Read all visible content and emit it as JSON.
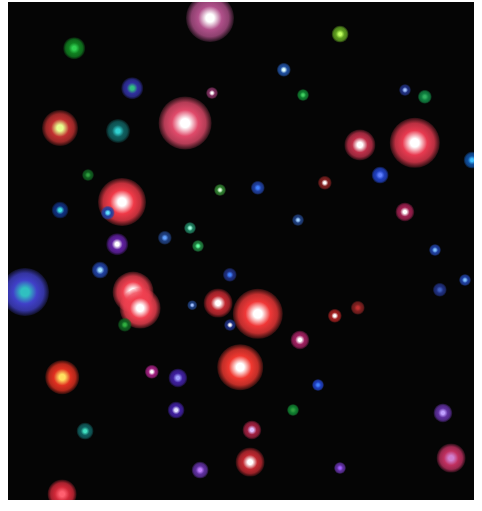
{
  "image": {
    "description": "Astronomical false-color star field",
    "background": "#050505",
    "frame": {
      "left": 8,
      "top": 2,
      "width": 466,
      "height": 498
    }
  },
  "stars": [
    {
      "x": 210,
      "y": 18,
      "r": 20,
      "halo": "#b0508a",
      "core": "#ffffff"
    },
    {
      "x": 185,
      "y": 123,
      "r": 22,
      "halo": "#e04a6a",
      "core": "#ffffff"
    },
    {
      "x": 415,
      "y": 143,
      "r": 21,
      "halo": "#e83a50",
      "core": "#ffffff"
    },
    {
      "x": 122,
      "y": 202,
      "r": 20,
      "halo": "#f03a48",
      "core": "#ffffff"
    },
    {
      "x": 60,
      "y": 128,
      "r": 15,
      "halo": "#c03030",
      "core": "#e8ff90"
    },
    {
      "x": 360,
      "y": 145,
      "r": 13,
      "halo": "#c0304a",
      "core": "#ffffff"
    },
    {
      "x": 133,
      "y": 292,
      "r": 17,
      "halo": "#f04050",
      "core": "#ffffff"
    },
    {
      "x": 140,
      "y": 308,
      "r": 17,
      "halo": "#f04050",
      "core": "#ffffff"
    },
    {
      "x": 258,
      "y": 314,
      "r": 21,
      "halo": "#f03838",
      "core": "#ffffff"
    },
    {
      "x": 240,
      "y": 367,
      "r": 19,
      "halo": "#f03830",
      "core": "#ffffff"
    },
    {
      "x": 218,
      "y": 303,
      "r": 12,
      "halo": "#c02830",
      "core": "#ffffff"
    },
    {
      "x": 62,
      "y": 377,
      "r": 14,
      "halo": "#e03020",
      "core": "#ffe060"
    },
    {
      "x": 25,
      "y": 292,
      "r": 20,
      "halo": "#4040c8",
      "core": "#30c0c0"
    },
    {
      "x": 451,
      "y": 458,
      "r": 12,
      "halo": "#c03060",
      "core": "#d080d0"
    },
    {
      "x": 250,
      "y": 462,
      "r": 12,
      "halo": "#c02830",
      "core": "#ffffff"
    },
    {
      "x": 62,
      "y": 494,
      "r": 12,
      "halo": "#d02838",
      "core": "#ff6070"
    },
    {
      "x": 74,
      "y": 48,
      "r": 9,
      "halo": "#108020",
      "core": "#30d050"
    },
    {
      "x": 340,
      "y": 34,
      "r": 7,
      "halo": "#60a020",
      "core": "#c0ff60"
    },
    {
      "x": 132,
      "y": 88,
      "r": 9,
      "halo": "#3030a0",
      "core": "#30c080"
    },
    {
      "x": 118,
      "y": 131,
      "r": 10,
      "halo": "#106060",
      "core": "#30d0d0"
    },
    {
      "x": 284,
      "y": 70,
      "r": 6,
      "halo": "#2050a0",
      "core": "#e0ffff"
    },
    {
      "x": 60,
      "y": 210,
      "r": 7,
      "halo": "#103080",
      "core": "#40e0e0"
    },
    {
      "x": 108,
      "y": 213,
      "r": 6,
      "halo": "#2040a0",
      "core": "#60e0ff"
    },
    {
      "x": 117,
      "y": 244,
      "r": 9,
      "halo": "#6020a0",
      "core": "#ffffff"
    },
    {
      "x": 100,
      "y": 270,
      "r": 7,
      "halo": "#2040a0",
      "core": "#a0e0ff"
    },
    {
      "x": 380,
      "y": 175,
      "r": 7,
      "halo": "#2040c0",
      "core": "#6080ff"
    },
    {
      "x": 472,
      "y": 160,
      "r": 7,
      "halo": "#1050a0",
      "core": "#40c0ff"
    },
    {
      "x": 405,
      "y": 212,
      "r": 8,
      "halo": "#a02050",
      "core": "#ffffff"
    },
    {
      "x": 325,
      "y": 183,
      "r": 6,
      "halo": "#802020",
      "core": "#ffffff"
    },
    {
      "x": 258,
      "y": 188,
      "r": 6,
      "halo": "#2040a0",
      "core": "#4080ff"
    },
    {
      "x": 220,
      "y": 190,
      "r": 5,
      "halo": "#308030",
      "core": "#e0ffe0"
    },
    {
      "x": 198,
      "y": 246,
      "r": 5,
      "halo": "#208040",
      "core": "#60ffa0"
    },
    {
      "x": 212,
      "y": 93,
      "r": 5,
      "halo": "#803060",
      "core": "#ffffff"
    },
    {
      "x": 303,
      "y": 95,
      "r": 5,
      "halo": "#108030",
      "core": "#40d060"
    },
    {
      "x": 425,
      "y": 97,
      "r": 6,
      "halo": "#108040",
      "core": "#30b060"
    },
    {
      "x": 405,
      "y": 90,
      "r": 5,
      "halo": "#203080",
      "core": "#a0c0ff"
    },
    {
      "x": 298,
      "y": 220,
      "r": 5,
      "halo": "#204080",
      "core": "#a0d0ff"
    },
    {
      "x": 300,
      "y": 340,
      "r": 8,
      "halo": "#a02060",
      "core": "#ffffff"
    },
    {
      "x": 230,
      "y": 325,
      "r": 5,
      "halo": "#203080",
      "core": "#ffffff"
    },
    {
      "x": 335,
      "y": 316,
      "r": 6,
      "halo": "#a02020",
      "core": "#ffffff"
    },
    {
      "x": 152,
      "y": 372,
      "r": 6,
      "halo": "#a02080",
      "core": "#ffffff"
    },
    {
      "x": 178,
      "y": 378,
      "r": 8,
      "halo": "#4020a0",
      "core": "#a0a0ff"
    },
    {
      "x": 176,
      "y": 410,
      "r": 7,
      "halo": "#4020a0",
      "core": "#e0e0ff"
    },
    {
      "x": 85,
      "y": 431,
      "r": 7,
      "halo": "#106060",
      "core": "#40e0c0"
    },
    {
      "x": 318,
      "y": 385,
      "r": 5,
      "halo": "#2040c0",
      "core": "#4080ff"
    },
    {
      "x": 293,
      "y": 410,
      "r": 5,
      "halo": "#108030",
      "core": "#30a040"
    },
    {
      "x": 443,
      "y": 413,
      "r": 8,
      "halo": "#6030a0",
      "core": "#c0a0ff"
    },
    {
      "x": 200,
      "y": 470,
      "r": 7,
      "halo": "#6030a0",
      "core": "#c080ff"
    },
    {
      "x": 340,
      "y": 468,
      "r": 5,
      "halo": "#6030a0",
      "core": "#a060ff"
    },
    {
      "x": 252,
      "y": 430,
      "r": 8,
      "halo": "#a02040",
      "core": "#e0c0ff"
    },
    {
      "x": 435,
      "y": 250,
      "r": 5,
      "halo": "#2040a0",
      "core": "#80c0ff"
    },
    {
      "x": 465,
      "y": 280,
      "r": 5,
      "halo": "#2040a0",
      "core": "#80c0ff"
    },
    {
      "x": 440,
      "y": 290,
      "r": 6,
      "halo": "#203080",
      "core": "#4060c0"
    },
    {
      "x": 358,
      "y": 308,
      "r": 6,
      "halo": "#802020",
      "core": "#c03030"
    },
    {
      "x": 190,
      "y": 228,
      "r": 5,
      "halo": "#208060",
      "core": "#a0ffe0"
    },
    {
      "x": 165,
      "y": 238,
      "r": 6,
      "halo": "#204080",
      "core": "#60a0ff"
    },
    {
      "x": 88,
      "y": 175,
      "r": 5,
      "halo": "#106020",
      "core": "#30a040"
    },
    {
      "x": 125,
      "y": 325,
      "r": 6,
      "halo": "#106020",
      "core": "#30b040"
    },
    {
      "x": 230,
      "y": 275,
      "r": 6,
      "halo": "#203080",
      "core": "#4080ff"
    },
    {
      "x": 192,
      "y": 305,
      "r": 4,
      "halo": "#204080",
      "core": "#a0c0ff"
    }
  ]
}
